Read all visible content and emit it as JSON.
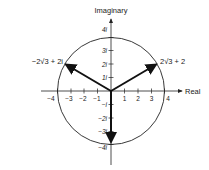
{
  "diagram": {
    "type": "complex-plane",
    "axes": {
      "x_label": "Real",
      "y_label": "Imaginary",
      "x_ticks": [
        "−4",
        "−3",
        "−2",
        "−1",
        "1",
        "2",
        "3",
        "4"
      ],
      "y_ticks_pos": [
        "1i",
        "2i",
        "3i",
        "4i"
      ],
      "y_ticks_neg": [
        "−i",
        "−2i",
        "−3i",
        "−4i"
      ]
    },
    "circle": {
      "center": "0",
      "radius": 4
    },
    "vectors": [
      {
        "label": "2√3 + 2",
        "real": 3.464,
        "imag": 2
      },
      {
        "label": "−2√3 + 2i",
        "real": -3.464,
        "imag": 2
      },
      {
        "label": "",
        "real": 0,
        "imag": -4
      }
    ],
    "labels": {
      "right_point": "2√3 + 2",
      "left_point": "−2√3 + 2i"
    }
  }
}
